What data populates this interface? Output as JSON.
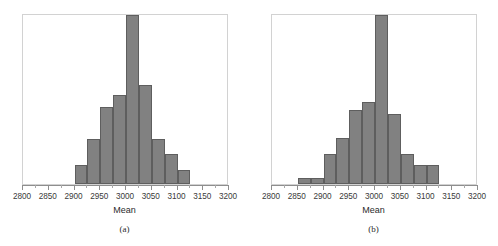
{
  "figure": {
    "background": "#ffffff",
    "bar_fill": "#818181",
    "bar_stroke": "#5e5e5e",
    "frame_color": "#d2d2d2",
    "axis_color": "#8e8e8e"
  },
  "panels": [
    {
      "caption": "(a)",
      "axis_title": "Mean",
      "tick_labels": [
        "2800",
        "2850",
        "2900",
        "2950",
        "3000",
        "3050",
        "3100",
        "3150",
        "3200"
      ]
    },
    {
      "caption": "(b)",
      "axis_title": "Mean",
      "tick_labels": [
        "2800",
        "2850",
        "2900",
        "2950",
        "3000",
        "3050",
        "3100",
        "3150",
        "3200"
      ]
    }
  ],
  "chart_data": [
    {
      "type": "bar",
      "title": "(a)",
      "xlabel": "Mean",
      "ylabel": "",
      "grid": false,
      "legend": "none",
      "xlim": [
        2800,
        3200
      ],
      "ylim": [
        0,
        1.0
      ],
      "xticks": [
        2800,
        2850,
        2900,
        2950,
        3000,
        3050,
        3100,
        3150,
        3200
      ],
      "xtick_labels": [
        "2800",
        "2850",
        "2900",
        "2950",
        "3000",
        "3050",
        "3100",
        "3150",
        "3200"
      ],
      "minor_xticks": [
        2825,
        2875,
        2925,
        2975,
        3025,
        3075,
        3125,
        3175
      ],
      "bin_width": 25,
      "bin_edges": [
        2900,
        2925,
        2950,
        2975,
        3000,
        3025,
        3050,
        3075,
        3100,
        3125
      ],
      "categories": [
        "2900-2925",
        "2925-2950",
        "2950-2975",
        "2975-3000",
        "3000-3025",
        "3025-3050",
        "3050-3075",
        "3075-3100",
        "3100-3125"
      ],
      "values": [
        0.115,
        0.266,
        0.456,
        0.526,
        1.0,
        0.585,
        0.266,
        0.175,
        0.082
      ]
    },
    {
      "type": "bar",
      "title": "(b)",
      "xlabel": "Mean",
      "ylabel": "",
      "grid": false,
      "legend": "none",
      "xlim": [
        2800,
        3200
      ],
      "ylim": [
        0,
        1.0
      ],
      "xticks": [
        2800,
        2850,
        2900,
        2950,
        3000,
        3050,
        3100,
        3150,
        3200
      ],
      "xtick_labels": [
        "2800",
        "2850",
        "2900",
        "2950",
        "3000",
        "3050",
        "3100",
        "3150",
        "3200"
      ],
      "minor_xticks": [
        2825,
        2875,
        2925,
        2975,
        3025,
        3075,
        3125,
        3175
      ],
      "bin_width": 25,
      "bin_edges": [
        2850,
        2875,
        2900,
        2925,
        2950,
        2975,
        3000,
        3025,
        3050,
        3075,
        3100,
        3125
      ],
      "categories": [
        "2850-2875",
        "2875-2900",
        "2900-2925",
        "2925-2950",
        "2950-2975",
        "2975-3000",
        "3000-3025",
        "3025-3050",
        "3050-3075",
        "3075-3100",
        "3100-3125"
      ],
      "values": [
        0.035,
        0.035,
        0.175,
        0.272,
        0.44,
        0.485,
        1.0,
        0.415,
        0.175,
        0.115,
        0.115
      ]
    }
  ]
}
